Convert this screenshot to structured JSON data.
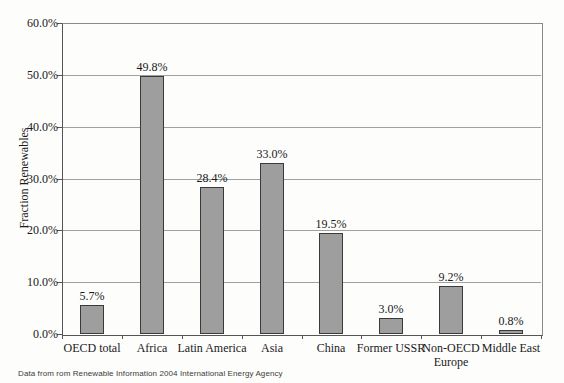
{
  "chart_data": {
    "type": "bar",
    "title": "",
    "xlabel": "",
    "ylabel": "Fraction Renewables",
    "categories": [
      "OECD total",
      "Africa",
      "Latin America",
      "Asia",
      "China",
      "Former USSR",
      "Non-OECD Europe",
      "Middle East"
    ],
    "values": [
      5.7,
      49.8,
      28.4,
      33.0,
      19.5,
      3.0,
      9.2,
      0.8
    ],
    "value_labels": [
      "5.7%",
      "49.8%",
      "28.4%",
      "33.0%",
      "19.5%",
      "3.0%",
      "9.2%",
      "0.8%"
    ],
    "ylim": [
      0,
      60
    ],
    "ytick_step": 10,
    "ytick_labels": [
      "0.0%",
      "10.0%",
      "20.0%",
      "30.0%",
      "40.0%",
      "50.0%",
      "60.0%"
    ],
    "grid": true,
    "legend": "none",
    "colors": {
      "bar_fill": "#9e9e9e",
      "bar_border": "#3a3a3a",
      "gridline": "#a0a0a0",
      "axis": "#555555",
      "text": "#1a1a1a"
    }
  },
  "footer": {
    "text": "Data from rom Renewable Information 2004 International Energy Agency"
  }
}
